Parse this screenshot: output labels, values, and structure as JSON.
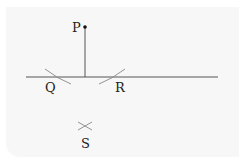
{
  "diagram": {
    "labels": {
      "P": "P",
      "Q": "Q",
      "R": "R",
      "S": "S"
    },
    "elements": {
      "point_P": {
        "x": 85,
        "y": 27
      },
      "line": {
        "x1": 26,
        "y1": 77,
        "x2": 218,
        "y2": 77
      },
      "perpendicular": {
        "x1": 85,
        "y1": 27,
        "x2": 85,
        "y2": 77
      },
      "arc_Q": "arc intersecting line left of foot",
      "arc_R": "arc intersecting line right of foot",
      "cross_S": {
        "x": 85,
        "y": 126
      }
    },
    "colors": {
      "line": "#555555",
      "arc": "#888888",
      "point": "#111111",
      "text": "#222222",
      "background": "#f7f7f7"
    }
  }
}
